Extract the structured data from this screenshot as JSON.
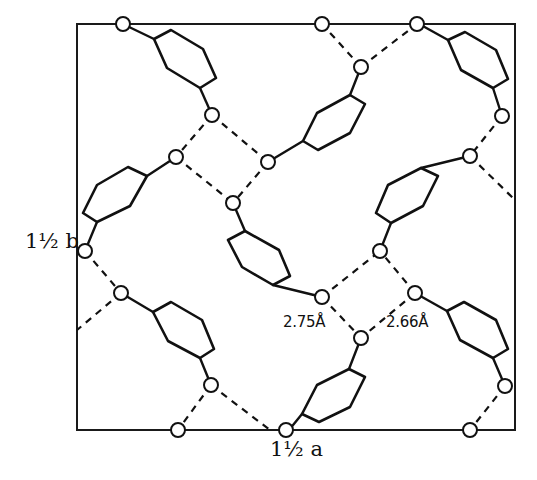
{
  "figure": {
    "type": "crystal packing diagram (hydrogen-bonded network)",
    "axis_b_label": "1½ b",
    "axis_a_label": "1½ a",
    "distance_labels": [
      {
        "text": "2.75Å",
        "x": 283,
        "y": 313
      },
      {
        "text": "2.66Å",
        "x": 386,
        "y": 313
      }
    ],
    "frame": {
      "x1": 77,
      "y1": 24,
      "x2": 515,
      "y2": 430
    },
    "colors": {
      "line": "#111111",
      "background": "#ffffff"
    },
    "rings": [
      [
        [
          154,
          39
        ],
        [
          171,
          30
        ],
        [
          203,
          49
        ],
        [
          216,
          78
        ],
        [
          200,
          88
        ],
        [
          167,
          68
        ]
      ],
      [
        [
          97,
          185
        ],
        [
          128,
          167
        ],
        [
          147,
          176
        ],
        [
          130,
          206
        ],
        [
          97,
          222
        ],
        [
          83,
          213
        ]
      ],
      [
        [
          245,
          231
        ],
        [
          279,
          250
        ],
        [
          290,
          276
        ],
        [
          273,
          285
        ],
        [
          242,
          267
        ],
        [
          228,
          240
        ]
      ],
      [
        [
          153,
          312
        ],
        [
          171,
          302
        ],
        [
          202,
          320
        ],
        [
          214,
          349
        ],
        [
          200,
          358
        ],
        [
          168,
          341
        ]
      ],
      [
        [
          349,
          369
        ],
        [
          365,
          377
        ],
        [
          350,
          407
        ],
        [
          319,
          422
        ],
        [
          302,
          414
        ],
        [
          317,
          385
        ]
      ],
      [
        [
          388,
          185
        ],
        [
          421,
          168
        ],
        [
          438,
          176
        ],
        [
          423,
          206
        ],
        [
          391,
          223
        ],
        [
          376,
          213
        ]
      ],
      [
        [
          448,
          40
        ],
        [
          465,
          32
        ],
        [
          496,
          50
        ],
        [
          508,
          79
        ],
        [
          493,
          88
        ],
        [
          461,
          70
        ]
      ],
      [
        [
          447,
          311
        ],
        [
          464,
          302
        ],
        [
          496,
          320
        ],
        [
          508,
          349
        ],
        [
          493,
          358
        ],
        [
          460,
          340
        ]
      ],
      [
        [
          350,
          95
        ],
        [
          365,
          104
        ],
        [
          350,
          133
        ],
        [
          318,
          150
        ],
        [
          303,
          141
        ],
        [
          317,
          113
        ]
      ]
    ],
    "atoms": [
      [
        123,
        24
      ],
      [
        212,
        115
      ],
      [
        176,
        157
      ],
      [
        268,
        162
      ],
      [
        233,
        203
      ],
      [
        85,
        251
      ],
      [
        121,
        293
      ],
      [
        211,
        385
      ],
      [
        178,
        430
      ],
      [
        322,
        297
      ],
      [
        361,
        338
      ],
      [
        415,
        293
      ],
      [
        380,
        251
      ],
      [
        470,
        156
      ],
      [
        361,
        67
      ],
      [
        322,
        24
      ],
      [
        417,
        24
      ],
      [
        502,
        116
      ],
      [
        505,
        386
      ],
      [
        470,
        430
      ],
      [
        286,
        430
      ]
    ],
    "bonds": [
      [
        [
          154,
          39
        ],
        [
          127,
          26
        ]
      ],
      [
        [
          200,
          88
        ],
        [
          212,
          115
        ]
      ],
      [
        [
          147,
          176
        ],
        [
          176,
          157
        ]
      ],
      [
        [
          97,
          222
        ],
        [
          85,
          251
        ]
      ],
      [
        [
          245,
          231
        ],
        [
          233,
          203
        ]
      ],
      [
        [
          273,
          285
        ],
        [
          322,
          297
        ]
      ],
      [
        [
          153,
          312
        ],
        [
          121,
          293
        ]
      ],
      [
        [
          200,
          358
        ],
        [
          211,
          385
        ]
      ],
      [
        [
          349,
          369
        ],
        [
          361,
          338
        ]
      ],
      [
        [
          302,
          414
        ],
        [
          289,
          430
        ]
      ],
      [
        [
          421,
          168
        ],
        [
          470,
          156
        ]
      ],
      [
        [
          391,
          223
        ],
        [
          380,
          251
        ]
      ],
      [
        [
          448,
          40
        ],
        [
          421,
          25
        ]
      ],
      [
        [
          493,
          88
        ],
        [
          502,
          116
        ]
      ],
      [
        [
          447,
          311
        ],
        [
          415,
          293
        ]
      ],
      [
        [
          493,
          358
        ],
        [
          505,
          386
        ]
      ],
      [
        [
          350,
          95
        ],
        [
          361,
          67
        ]
      ],
      [
        [
          303,
          141
        ],
        [
          268,
          162
        ]
      ]
    ],
    "hbonds": [
      [
        [
          212,
          115
        ],
        [
          176,
          157
        ]
      ],
      [
        [
          212,
          115
        ],
        [
          268,
          162
        ]
      ],
      [
        [
          176,
          157
        ],
        [
          233,
          203
        ]
      ],
      [
        [
          268,
          162
        ],
        [
          233,
          203
        ]
      ],
      [
        [
          85,
          251
        ],
        [
          121,
          293
        ]
      ],
      [
        [
          121,
          293
        ],
        [
          77,
          330
        ]
      ],
      [
        [
          211,
          385
        ],
        [
          178,
          430
        ]
      ],
      [
        [
          211,
          385
        ],
        [
          270,
          430
        ]
      ],
      [
        [
          322,
          297
        ],
        [
          361,
          338
        ]
      ],
      [
        [
          322,
          297
        ],
        [
          380,
          251
        ]
      ],
      [
        [
          415,
          293
        ],
        [
          380,
          251
        ]
      ],
      [
        [
          415,
          293
        ],
        [
          361,
          338
        ]
      ],
      [
        [
          502,
          116
        ],
        [
          470,
          156
        ]
      ],
      [
        [
          470,
          156
        ],
        [
          515,
          200
        ]
      ],
      [
        [
          361,
          67
        ],
        [
          322,
          24
        ]
      ],
      [
        [
          361,
          67
        ],
        [
          417,
          24
        ]
      ],
      [
        [
          505,
          386
        ],
        [
          470,
          430
        ]
      ]
    ]
  }
}
